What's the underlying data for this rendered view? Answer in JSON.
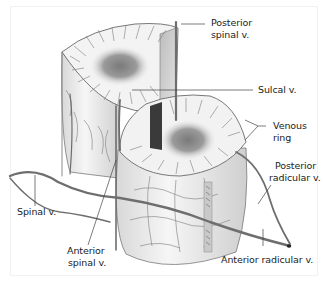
{
  "figure": {
    "labels": [
      {
        "id": "posterior-spinal-v",
        "lines": [
          "Posterior",
          "spinal v."
        ]
      },
      {
        "id": "sulcal-v",
        "lines": [
          "Sulcal v."
        ]
      },
      {
        "id": "venous-ring",
        "lines": [
          "Venous",
          "ring"
        ]
      },
      {
        "id": "posterior-radicular-v",
        "lines": [
          "Posterior",
          "radicular v."
        ]
      },
      {
        "id": "spinal-v",
        "lines": [
          "Spinal v."
        ]
      },
      {
        "id": "anterior-spinal-v",
        "lines": [
          "Anterior",
          "spinal v."
        ]
      },
      {
        "id": "anterior-radicular-v",
        "lines": [
          "Anterior radicular v."
        ]
      }
    ],
    "colors": {
      "background": "#ffffff",
      "vein": "#6e6e6e",
      "grey_matter": "#8a8a8a",
      "white_matter": "#f4f4f4",
      "leader_line": "#444444",
      "text": "#222222"
    }
  }
}
